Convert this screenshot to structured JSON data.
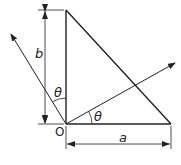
{
  "diagram": {
    "labels": {
      "b": "b",
      "a": "a",
      "origin": "O",
      "angle_top": "θ",
      "angle_right": "θ"
    },
    "colors": {
      "line": "#222222",
      "background": "#ffffff"
    }
  }
}
